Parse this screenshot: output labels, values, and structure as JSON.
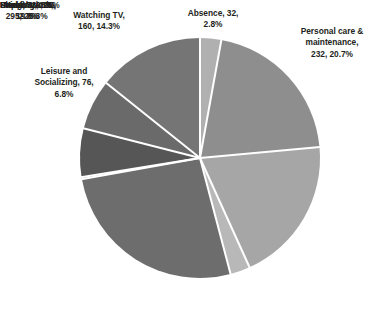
{
  "chart_data": {
    "type": "pie",
    "title": "",
    "subtitle": "",
    "xlabel": "",
    "ylabel": "",
    "grid": false,
    "legend_position": "none",
    "label_format": "name, value, percent",
    "total": 1122,
    "start_angle_deg": 0,
    "direction": "clockwise",
    "center": {
      "x": 200,
      "y": 158
    },
    "radius": 120,
    "slice_gap_color": "#ffffff",
    "slices": [
      {
        "name": "Absence",
        "value": 32,
        "percent": "2.8%",
        "percent_num": 2.8,
        "color": "#b0b0b0",
        "label": "Absence, 32,\n2.8%"
      },
      {
        "name": "Personal care & maintenance",
        "value": 232,
        "percent": "20.7%",
        "percent_num": 20.7,
        "color": "#8e8e8e",
        "label": "Personal care &\nmaintenance,\n232, 20.7%"
      },
      {
        "name": "Sleeping",
        "value": 221,
        "percent": "19.8%",
        "percent_num": 19.8,
        "color": "#a6a6a6",
        "label": "Sleeping, 221,\n19.8%"
      },
      {
        "name": "Paid Work",
        "value": 30,
        "percent": "2.7%",
        "percent_num": 2.7,
        "color": "#b8b8b8",
        "label": "Paid Work, 30,\n2.7%"
      },
      {
        "name": "Unpaid Work",
        "value": 295,
        "percent": "26.3%",
        "percent_num": 26.3,
        "color": "#6d6d6d",
        "label": "Unpaid Work,\n295, 26.3%"
      },
      {
        "name": "Study",
        "value": 3,
        "percent": "0.2%",
        "percent_num": 0.2,
        "color": "#8a8a8a",
        "label": "Study, 3, 0.2%"
      },
      {
        "name": "Meal",
        "value": 73,
        "percent": "6.5%",
        "percent_num": 6.5,
        "color": "#565656",
        "label": "Meal, 73, 6.5%"
      },
      {
        "name": "Leisure and Socializing",
        "value": 76,
        "percent": "6.8%",
        "percent_num": 6.8,
        "color": "#6a6a6a",
        "label": "Leisure and\nSocializing, 76,\n6.8%"
      },
      {
        "name": "Watching TV",
        "value": 160,
        "percent": "14.3%",
        "percent_num": 14.3,
        "color": "#757575",
        "label": "Watching TV,\n160, 14.3%"
      }
    ]
  }
}
